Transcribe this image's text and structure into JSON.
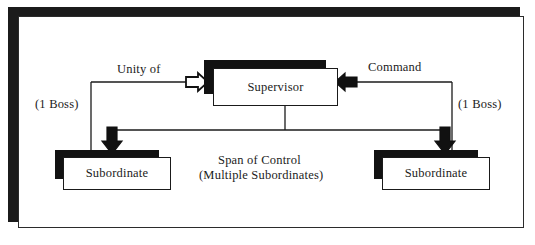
{
  "diagram": {
    "type": "organizational-hierarchy",
    "colors": {
      "line": "#1b1b1b",
      "shadow": "#121212",
      "box_fill": "#ffffff",
      "page": "#ffffff",
      "arrow_black": "#121212",
      "arrow_white": "#ffffff"
    },
    "nodes": [
      {
        "id": "supervisor",
        "label": "Supervisor"
      },
      {
        "id": "subordinate_left",
        "label": "Subordinate"
      },
      {
        "id": "subordinate_right",
        "label": "Subordinate"
      }
    ],
    "labels": {
      "unity_of": "Unity of",
      "command": "Command",
      "boss_left": "(1 Boss)",
      "boss_right": "(1 Boss)",
      "span_line1": "Span of Control",
      "span_line2": "(Multiple Subordinates)"
    },
    "arrows": [
      {
        "id": "unity-in-arrow",
        "direction": "right",
        "style": "outline-white",
        "target": "supervisor"
      },
      {
        "id": "command-in-arrow",
        "direction": "left",
        "style": "solid-black",
        "target": "supervisor"
      },
      {
        "id": "down-arrow-left",
        "direction": "down",
        "style": "solid-black",
        "target": "subordinate_left"
      },
      {
        "id": "down-arrow-right",
        "direction": "down",
        "style": "solid-black",
        "target": "subordinate_right"
      }
    ]
  }
}
